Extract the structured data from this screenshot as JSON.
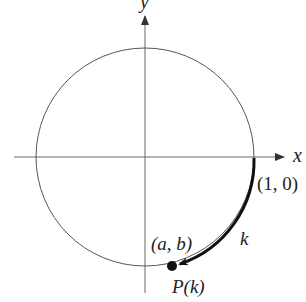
{
  "diagram": {
    "axes": {
      "x_label": "x",
      "y_label": "y"
    },
    "circle": {
      "center": [
        145,
        157
      ],
      "radius": 109,
      "stroke": "#555555"
    },
    "arc": {
      "label": "k",
      "stroke": "#111111",
      "direction": "clockwise"
    },
    "points": {
      "start_label": "(1, 0)",
      "end_coord_label": "(a, b)",
      "end_name_label": "P(k)"
    }
  }
}
